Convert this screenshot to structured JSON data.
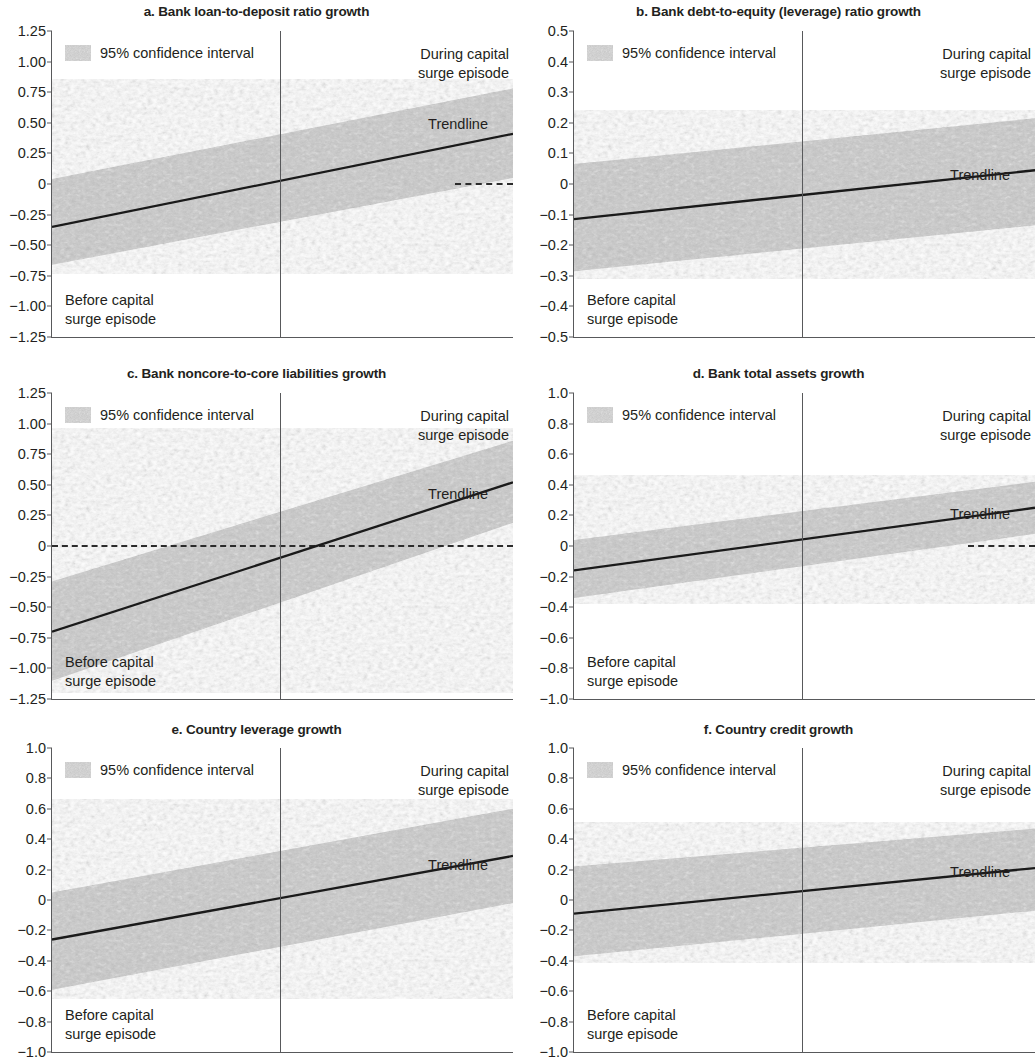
{
  "figure": {
    "legend_label": "95% confidence interval",
    "trendline_label": "Trendline",
    "before_label": "Before capital\nsurge episode",
    "during_label": "During capital\nsurge episode",
    "band_color": "#c9c9c9",
    "line_color": "#1a1a1a",
    "axis_color": "#58595b"
  },
  "chart_data": [
    {
      "type": "line",
      "panel": "a",
      "title": "a. Bank loan-to-deposit ratio growth",
      "xlabel": "",
      "ylabel": "",
      "ylim": [
        -1.25,
        1.25
      ],
      "yticks": [
        "1.25",
        "1.00",
        "0.75",
        "0.50",
        "0.25",
        "0",
        "−0.25",
        "−0.50",
        "−0.75",
        "−1.00",
        "−1.25"
      ],
      "ytick_values": [
        1.25,
        1.0,
        0.75,
        0.5,
        0.25,
        0,
        -0.25,
        -0.5,
        -0.75,
        -1.0,
        -1.25
      ],
      "grid": false,
      "legend_position": "top-left",
      "divider_x_fraction": 0.495,
      "zero_dash": {
        "from_fraction": 0.875,
        "to_fraction": 1.0,
        "value": 0
      },
      "series": [
        {
          "name": "Trendline",
          "x": [
            0,
            1
          ],
          "values": [
            -0.35,
            0.41
          ]
        },
        {
          "name": "95% confidence interval upper",
          "x": [
            0,
            1
          ],
          "values": [
            0.04,
            0.78
          ]
        },
        {
          "name": "95% confidence interval lower",
          "x": [
            0,
            1
          ],
          "values": [
            -0.66,
            0.05
          ]
        }
      ],
      "annotations": {
        "before": "Before capital\nsurge episode",
        "during": "During capital\nsurge episode",
        "trendline": "Trendline"
      }
    },
    {
      "type": "line",
      "panel": "b",
      "title": "b. Bank debt-to-equity (leverage) ratio growth",
      "xlabel": "",
      "ylabel": "",
      "ylim": [
        -0.5,
        0.5
      ],
      "yticks": [
        "0.5",
        "0.4",
        "0.3",
        "0.2",
        "0.1",
        "0",
        "−0.1",
        "−0.2",
        "−0.3",
        "−0.4",
        "−0.5"
      ],
      "ytick_values": [
        0.5,
        0.4,
        0.3,
        0.2,
        0.1,
        0,
        -0.1,
        -0.2,
        -0.3,
        -0.4,
        -0.5
      ],
      "grid": false,
      "legend_position": "top-left",
      "divider_x_fraction": 0.495,
      "zero_dash": null,
      "series": [
        {
          "name": "Trendline",
          "x": [
            0,
            1
          ],
          "values": [
            -0.115,
            0.045
          ]
        },
        {
          "name": "95% confidence interval upper",
          "x": [
            0,
            1
          ],
          "values": [
            0.065,
            0.215
          ]
        },
        {
          "name": "95% confidence interval lower",
          "x": [
            0,
            1
          ],
          "values": [
            -0.285,
            -0.135
          ]
        }
      ],
      "annotations": {
        "before": "Before capital\nsurge episode",
        "during": "During capital\nsurge episode",
        "trendline": "Trendline"
      }
    },
    {
      "type": "line",
      "panel": "c",
      "title": "c. Bank noncore-to-core liabilities growth",
      "xlabel": "",
      "ylabel": "",
      "ylim": [
        -1.25,
        1.25
      ],
      "yticks": [
        "1.25",
        "1.00",
        "0.75",
        "0.50",
        "0.25",
        "0",
        "−0.25",
        "−0.50",
        "−0.75",
        "−1.00",
        "−1.25"
      ],
      "ytick_values": [
        1.25,
        1.0,
        0.75,
        0.5,
        0.25,
        0,
        -0.25,
        -0.5,
        -0.75,
        -1.0,
        -1.25
      ],
      "grid": false,
      "legend_position": "top-left",
      "divider_x_fraction": 0.495,
      "zero_dash": {
        "from_fraction": 0.0,
        "to_fraction": 1.0,
        "value": 0
      },
      "series": [
        {
          "name": "Trendline",
          "x": [
            0,
            1
          ],
          "values": [
            -0.7,
            0.52
          ]
        },
        {
          "name": "95% confidence interval upper",
          "x": [
            0,
            1
          ],
          "values": [
            -0.29,
            0.86
          ]
        },
        {
          "name": "95% confidence interval lower",
          "x": [
            0,
            1
          ],
          "values": [
            -1.1,
            0.19
          ]
        }
      ],
      "annotations": {
        "before": "Before capital\nsurge episode",
        "during": "During capital\nsurge episode",
        "trendline": "Trendline"
      }
    },
    {
      "type": "line",
      "panel": "d",
      "title": "d. Bank total assets growth",
      "xlabel": "",
      "ylabel": "",
      "ylim": [
        -1.0,
        1.0
      ],
      "yticks": [
        "1.0",
        "0.8",
        "0.6",
        "0.4",
        "0.2",
        "0",
        "−0.2",
        "−0.4",
        "−0.6",
        "−0.8",
        "−1.0"
      ],
      "ytick_values": [
        1.0,
        0.8,
        0.6,
        0.4,
        0.2,
        0,
        -0.2,
        -0.4,
        -0.6,
        -0.8,
        -1.0
      ],
      "grid": false,
      "legend_position": "top-left",
      "divider_x_fraction": 0.495,
      "zero_dash": {
        "from_fraction": 0.855,
        "to_fraction": 1.0,
        "value": 0
      },
      "series": [
        {
          "name": "Trendline",
          "x": [
            0,
            1
          ],
          "values": [
            -0.16,
            0.25
          ]
        },
        {
          "name": "95% confidence interval upper",
          "x": [
            0,
            1
          ],
          "values": [
            0.04,
            0.42
          ]
        },
        {
          "name": "95% confidence interval lower",
          "x": [
            0,
            1
          ],
          "values": [
            -0.34,
            0.08
          ]
        }
      ],
      "annotations": {
        "before": "Before capital\nsurge episode",
        "during": "During capital\nsurge episode",
        "trendline": "Trendline"
      }
    },
    {
      "type": "line",
      "panel": "e",
      "title": "e. Country leverage growth",
      "xlabel": "",
      "ylabel": "",
      "ylim": [
        -1.0,
        1.0
      ],
      "yticks": [
        "1.0",
        "0.8",
        "0.6",
        "0.4",
        "0.2",
        "0",
        "−0.2",
        "−0.4",
        "−0.6",
        "−0.8",
        "−1.0"
      ],
      "ytick_values": [
        1.0,
        0.8,
        0.6,
        0.4,
        0.2,
        0,
        -0.2,
        -0.4,
        -0.6,
        -0.8,
        -1.0
      ],
      "grid": false,
      "legend_position": "top-left",
      "divider_x_fraction": 0.495,
      "zero_dash": null,
      "series": [
        {
          "name": "Trendline",
          "x": [
            0,
            1
          ],
          "values": [
            -0.26,
            0.29
          ]
        },
        {
          "name": "95% confidence interval upper",
          "x": [
            0,
            1
          ],
          "values": [
            0.05,
            0.6
          ]
        },
        {
          "name": "95% confidence interval lower",
          "x": [
            0,
            1
          ],
          "values": [
            -0.59,
            -0.02
          ]
        }
      ],
      "annotations": {
        "before": "Before capital\nsurge episode",
        "during": "During capital\nsurge episode",
        "trendline": "Trendline"
      }
    },
    {
      "type": "line",
      "panel": "f",
      "title": "f. Country credit growth",
      "xlabel": "",
      "ylabel": "",
      "ylim": [
        -1.0,
        1.0
      ],
      "yticks": [
        "1.0",
        "0.8",
        "0.6",
        "0.4",
        "0.2",
        "0",
        "−0.2",
        "−0.4",
        "−0.6",
        "−0.8",
        "−1.0"
      ],
      "ytick_values": [
        1.0,
        0.8,
        0.6,
        0.4,
        0.2,
        0,
        -0.2,
        -0.4,
        -0.6,
        -0.8,
        -1.0
      ],
      "grid": false,
      "legend_position": "top-left",
      "divider_x_fraction": 0.495,
      "zero_dash": null,
      "series": [
        {
          "name": "Trendline",
          "x": [
            0,
            1
          ],
          "values": [
            -0.09,
            0.21
          ]
        },
        {
          "name": "95% confidence interval upper",
          "x": [
            0,
            1
          ],
          "values": [
            0.22,
            0.47
          ]
        },
        {
          "name": "95% confidence interval lower",
          "x": [
            0,
            1
          ],
          "values": [
            -0.37,
            -0.07
          ]
        }
      ],
      "annotations": {
        "before": "Before capital\nsurge episode",
        "during": "During capital\nsurge episode",
        "trendline": "Trendline"
      }
    }
  ]
}
